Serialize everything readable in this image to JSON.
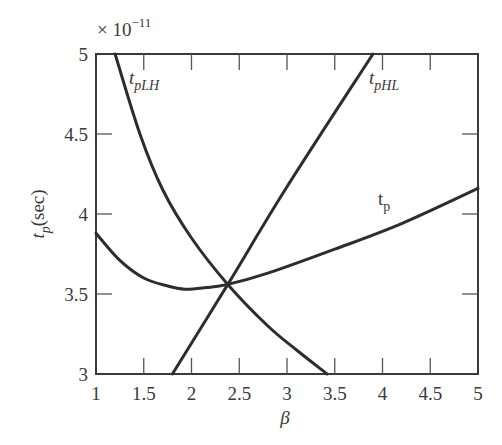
{
  "chart_data": {
    "type": "line",
    "title": "",
    "xlabel": "β",
    "ylabel": "t_p(sec)",
    "y_multiplier": "× 10^-11",
    "xlim": [
      1,
      5
    ],
    "ylim": [
      3,
      5
    ],
    "grid": false,
    "x_ticks": [
      "1",
      "1.5",
      "2",
      "2.5",
      "3",
      "3.5",
      "4",
      "4.5",
      "5"
    ],
    "y_ticks": [
      "3",
      "3.5",
      "4",
      "4.5",
      "5"
    ],
    "series": [
      {
        "name": "t_pLH",
        "x": [
          1.2,
          1.46,
          1.7,
          2.0,
          2.38,
          2.8,
          3.1,
          3.42
        ],
        "y": [
          5.0,
          4.5,
          4.15,
          3.85,
          3.56,
          3.3,
          3.15,
          3.0
        ]
      },
      {
        "name": "t_pHL",
        "x": [
          1.8,
          2.38,
          3.0,
          3.9
        ],
        "y": [
          3.0,
          3.56,
          4.17,
          5.0
        ]
      },
      {
        "name": "t_p",
        "x": [
          1.0,
          1.25,
          1.5,
          1.75,
          1.93,
          2.15,
          2.38,
          2.8,
          3.5,
          4.2,
          5.0
        ],
        "y": [
          3.88,
          3.71,
          3.6,
          3.55,
          3.53,
          3.54,
          3.56,
          3.63,
          3.78,
          3.94,
          4.16
        ]
      }
    ],
    "annotations": [
      {
        "text": "t_pLH",
        "x": 1.33,
        "y": 4.8
      },
      {
        "text": "t_pHL",
        "x": 3.85,
        "y": 4.8
      },
      {
        "text": "t_p",
        "x": 3.95,
        "y": 4.03
      }
    ]
  },
  "labels": {
    "multiplier_base": "× 10",
    "multiplier_exp": "−11",
    "ylabel_main": "t",
    "ylabel_sub": "p",
    "ylabel_unit": "(sec)",
    "xlabel": "β",
    "series_labels": {
      "tplh_main": "t",
      "tplh_sub": "pLH",
      "tphl_main": "t",
      "tphl_sub": "pHL",
      "tp_main": "t",
      "tp_sub": "p"
    }
  }
}
